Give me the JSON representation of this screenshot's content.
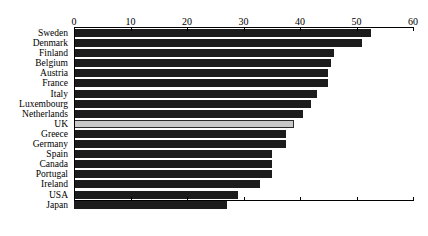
{
  "chart_data": {
    "type": "bar",
    "orientation": "horizontal",
    "title": "",
    "subtitle": "",
    "xlabel": "",
    "ylabel": "",
    "xlim": [
      0,
      60
    ],
    "xticks": [
      0,
      10,
      20,
      30,
      40,
      50,
      60
    ],
    "grid": false,
    "legend": null,
    "highlight_category": "UK",
    "colors": {
      "bar": "#1c1c1c",
      "highlight_bar": "#c8c8c8",
      "highlight_border": "#2a2a2a",
      "axis": "#000000",
      "background": "#ffffff",
      "text": "#000000"
    },
    "categories": [
      "Sweden",
      "Denmark",
      "Finland",
      "Belgium",
      "Austria",
      "France",
      "Italy",
      "Luxembourg",
      "Netherlands",
      "UK",
      "Greece",
      "Germany",
      "Spain",
      "Canada",
      "Portugal",
      "Ireland",
      "USA",
      "Japan"
    ],
    "values": [
      52.5,
      51,
      46,
      45.5,
      45,
      45,
      43,
      42,
      40.5,
      39,
      37.5,
      37.5,
      35,
      35,
      35,
      33,
      29,
      27
    ]
  }
}
